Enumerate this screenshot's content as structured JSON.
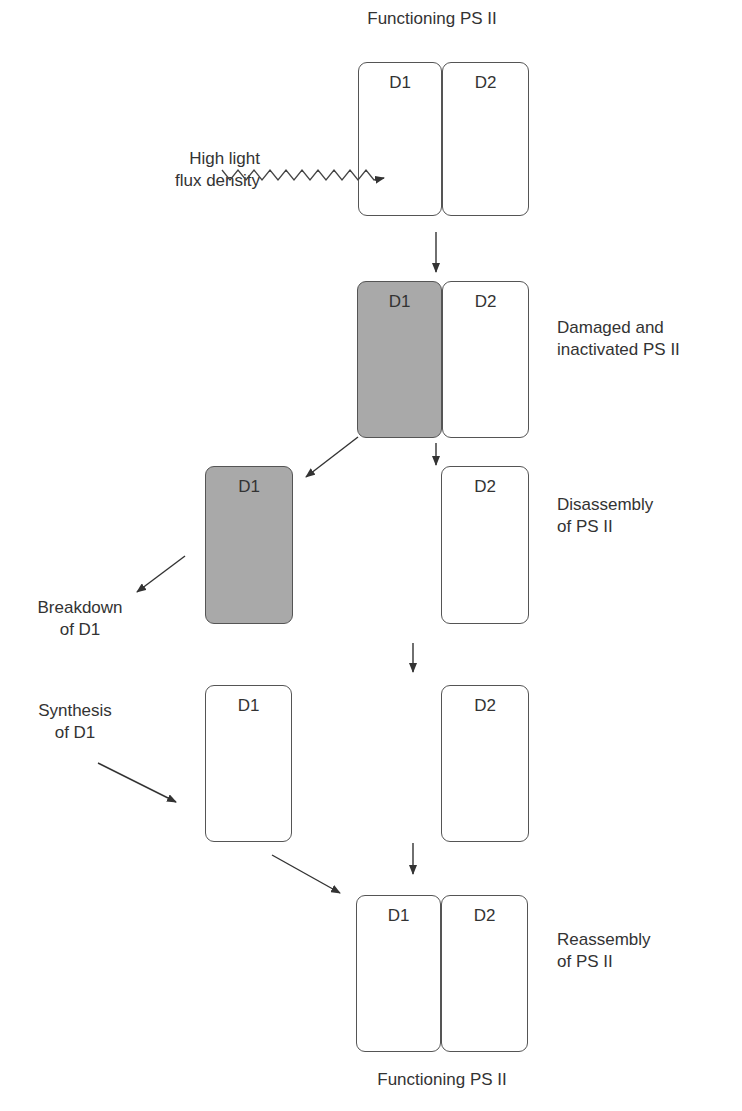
{
  "diagram": {
    "title_top": "Functioning PS II",
    "title_bottom": "Functioning PS II",
    "light_label": [
      "High light",
      "flux density"
    ],
    "stages": [
      {
        "id": "functioning",
        "subunits": [
          "D1",
          "D2"
        ],
        "state": "normal"
      },
      {
        "id": "damaged",
        "subunits": [
          "D1",
          "D2"
        ],
        "state": "D1 damaged",
        "label": [
          "Damaged and",
          "inactivated PS II"
        ]
      },
      {
        "id": "disassembly",
        "subunits": [
          "D1",
          "D2"
        ],
        "state": "separated, D1 damaged",
        "label": [
          "Disassembly",
          "of PS II"
        ]
      },
      {
        "id": "synthesis",
        "subunits": [
          "D1",
          "D2"
        ],
        "state": "separated, new D1"
      },
      {
        "id": "reassembly",
        "subunits": [
          "D1",
          "D2"
        ],
        "state": "normal",
        "label": [
          "Reassembly",
          "of PS II"
        ]
      }
    ],
    "side_labels": {
      "breakdown": [
        "Breakdown",
        "of D1"
      ],
      "synthesis": [
        "Synthesis",
        "of D1"
      ]
    },
    "colors": {
      "damaged_fill": "#a9a9a9",
      "outline": "#555555",
      "text": "#333333"
    }
  }
}
